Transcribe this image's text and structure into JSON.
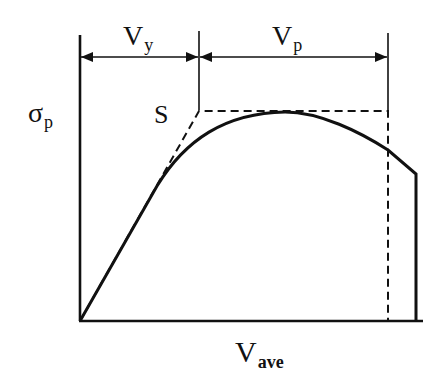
{
  "diagram": {
    "type": "stress-volume-schematic",
    "colors": {
      "ink": "#111111",
      "background": "#ffffff"
    },
    "labels": {
      "y_axis": {
        "main": "σ",
        "sub": "p"
      },
      "x_axis": {
        "main": "V",
        "sub": "ave"
      },
      "vy": {
        "main": "V",
        "sub": "y"
      },
      "vp": {
        "main": "V",
        "sub": "p"
      },
      "point_s": "S"
    },
    "dimensions": [
      {
        "name": "Vy",
        "from": "origin",
        "to": "S",
        "arrows": "both"
      },
      {
        "name": "Vp",
        "from": "S",
        "to": "plateau-end",
        "arrows": "both"
      }
    ],
    "curves": [
      {
        "name": "actual-response",
        "style": "solid",
        "description": "linear rise, rounded peak, descending branch, vertical drop"
      },
      {
        "name": "idealized-bilinear",
        "style": "dashed",
        "description": "linear rise to S, flat plateau, vertical drop"
      }
    ]
  }
}
